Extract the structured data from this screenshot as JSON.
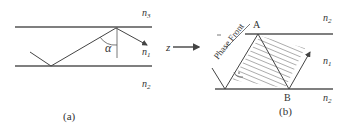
{
  "panel_a": {
    "caption": "(a)",
    "labels": {
      "top": "n",
      "top_sub": "3",
      "core": "n",
      "core_sub": "1",
      "bottom": "n",
      "bottom_sub": "2"
    },
    "angle_label": "α"
  },
  "axis": {
    "label": "z"
  },
  "panel_b": {
    "caption": "(b)",
    "phase_front_label": "Phase Front",
    "point_a": "A",
    "point_b": "B",
    "labels": {
      "top": "n",
      "top_sub": "2",
      "core": "n",
      "core_sub": "1",
      "bottom": "n",
      "bottom_sub": "2"
    }
  },
  "colors": {
    "line": "#555555",
    "text": "#333333",
    "hatch": "#888888"
  }
}
